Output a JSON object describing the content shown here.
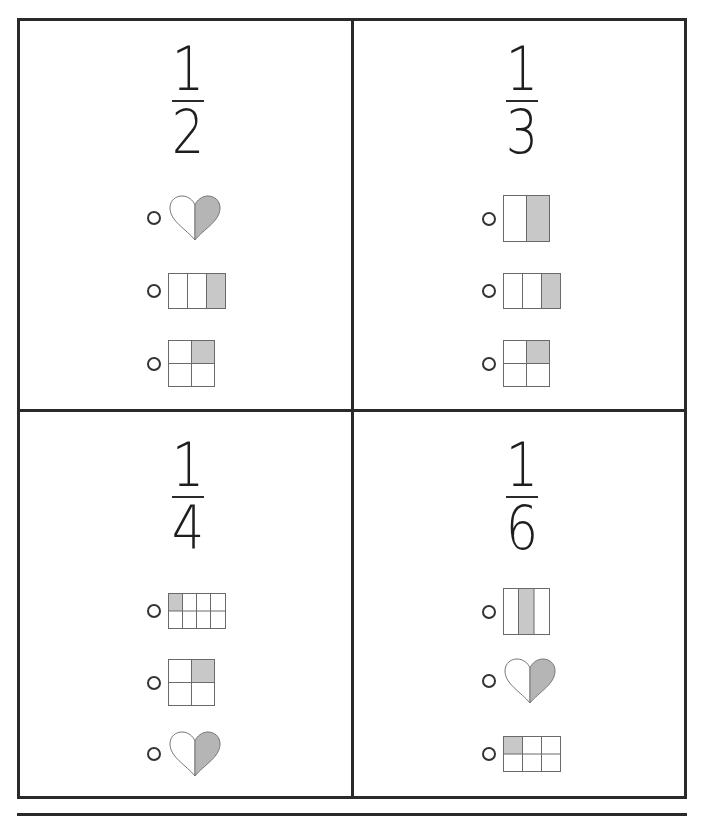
{
  "worksheet": {
    "colors": {
      "border": "#2a2a2a",
      "shade": "#c8c8c8",
      "heart_shade": "#b5b5b5",
      "grid_line": "#6a6a6a"
    },
    "page_number": "",
    "panels": [
      {
        "id": "half",
        "fraction": {
          "numerator": "1",
          "denominator": "2"
        },
        "options": [
          {
            "shape": "heart",
            "description": "heart split in 2 halves, right half shaded",
            "parts": 2,
            "shaded": 1
          },
          {
            "shape": "bar-3",
            "description": "rectangle split into 3 columns, right column shaded",
            "parts": 3,
            "shaded": 1
          },
          {
            "shape": "grid-2x2",
            "description": "square split into 4 quarters, top-right shaded",
            "parts": 4,
            "shaded": 1
          }
        ]
      },
      {
        "id": "third",
        "fraction": {
          "numerator": "1",
          "denominator": "3"
        },
        "options": [
          {
            "shape": "bar-2",
            "description": "square split into 2 columns, right column shaded",
            "parts": 2,
            "shaded": 1
          },
          {
            "shape": "bar-3",
            "description": "rectangle split into 3 columns, right column shaded",
            "parts": 3,
            "shaded": 1
          },
          {
            "shape": "grid-2x2",
            "description": "square split into 4 quarters, top-right shaded",
            "parts": 4,
            "shaded": 1
          }
        ]
      },
      {
        "id": "quarter",
        "fraction": {
          "numerator": "1",
          "denominator": "4"
        },
        "options": [
          {
            "shape": "grid-4x2",
            "description": "rectangle split into 8 cells, top-left shaded",
            "parts": 8,
            "shaded": 1
          },
          {
            "shape": "grid-2x2",
            "description": "square split into 4 quarters, top-right shaded",
            "parts": 4,
            "shaded": 1
          },
          {
            "shape": "heart",
            "description": "heart split in 2 halves, right half shaded",
            "parts": 2,
            "shaded": 1
          }
        ]
      },
      {
        "id": "sixth",
        "fraction": {
          "numerator": "1",
          "denominator": "6"
        },
        "options": [
          {
            "shape": "bar-3-middle",
            "description": "square split into 3 columns, middle column shaded",
            "parts": 3,
            "shaded": 1
          },
          {
            "shape": "heart",
            "description": "heart split in 2 halves, right half shaded",
            "parts": 2,
            "shaded": 1
          },
          {
            "shape": "grid-3x2",
            "description": "rectangle split into 6 cells, top-left shaded",
            "parts": 6,
            "shaded": 1
          }
        ]
      }
    ]
  }
}
